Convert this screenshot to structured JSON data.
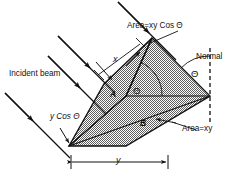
{
  "figure": {
    "type": "physics-optics-diagram",
    "background_color": "#ffffff",
    "ink_color": "#111111",
    "fill_color": "#9a9a9a",
    "labels": {
      "incident_beam": "Incident beam",
      "area_projected": "Area=xy Cos Θ",
      "area_true": "Area=xy",
      "normal": "Normal",
      "y_cos_theta": "y Cos Θ",
      "dim_x": "x",
      "dim_y": "y",
      "region_a": "A",
      "region_b": "B",
      "theta_surface": "Θ",
      "theta_normal": "Θ"
    }
  },
  "geometry": {
    "base_parallelogram": {
      "name": "Area=xy",
      "points": "69,146 152,38 210,96 126,146"
    },
    "projected_face": {
      "name": "Area=xy Cos Theta",
      "points": "69,146 104,84 152,38 126,96"
    },
    "beams": [
      {
        "name": "incident-beam-1",
        "x1": 118,
        "y1": 2,
        "x2": 172,
        "y2": 56,
        "arrow_at": 0.55
      },
      {
        "name": "incident-beam-2",
        "x1": 58,
        "y1": 36,
        "x2": 112,
        "y2": 90,
        "arrow_at": 0.55
      },
      {
        "name": "incident-beam-3",
        "x1": 50,
        "y1": 55,
        "x2": 104,
        "y2": 109,
        "arrow_at": 0.55
      },
      {
        "name": "incident-beam-4",
        "x1": 6,
        "y1": 92,
        "x2": 70,
        "y2": 156,
        "arrow_at": 0.5
      }
    ],
    "normal_line": {
      "x": 210,
      "y1": 48,
      "y2": 120
    },
    "theta_arc_normal": {
      "cx": 210,
      "cy": 96,
      "r": 42
    },
    "theta_arc_surface": {
      "cx": 126,
      "cy": 96,
      "r": 32
    },
    "dimension_y": {
      "x1": 69,
      "x2": 170,
      "y": 162
    },
    "leader_area_xy": {
      "x1": 200,
      "y1": 128,
      "x2": 160,
      "y2": 120
    },
    "leader_area_cos": {
      "x1": 176,
      "y1": 30,
      "x2": 140,
      "y2": 58
    }
  }
}
